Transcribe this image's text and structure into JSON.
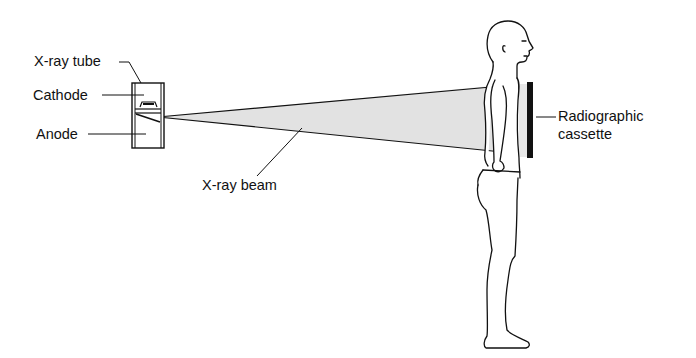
{
  "diagram": {
    "labels": {
      "xray_tube": "X-ray tube",
      "cathode": "Cathode",
      "anode": "Anode",
      "xray_beam": "X-ray beam",
      "cassette_line1": "Radiographic",
      "cassette_line2": "cassette"
    },
    "colors": {
      "line": "#111111",
      "beam_fill": "#e2e2e2",
      "background": "#ffffff"
    }
  }
}
